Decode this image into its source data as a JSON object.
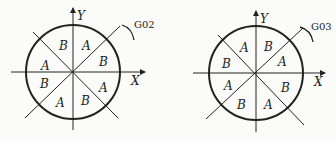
{
  "diagrams": [
    {
      "id": "left",
      "code": "G02",
      "axis_x": "X",
      "axis_y": "Y",
      "center": [
        73,
        72
      ],
      "radius": 47,
      "sectors": [
        "B",
        "A",
        "B",
        "A",
        "B",
        "A",
        "B",
        "A"
      ],
      "sector_order": "clockwise from top-left of +Y: upper-left, upper-right, right-upper, right-lower, lower-right, lower-left, left-lower, left-upper"
    },
    {
      "id": "right",
      "code": "G03",
      "axis_x": "X",
      "axis_y": "Y",
      "center": [
        256,
        73
      ],
      "radius": 47,
      "sectors": [
        "A",
        "B",
        "A",
        "B",
        "A",
        "B",
        "A",
        "B"
      ]
    }
  ]
}
